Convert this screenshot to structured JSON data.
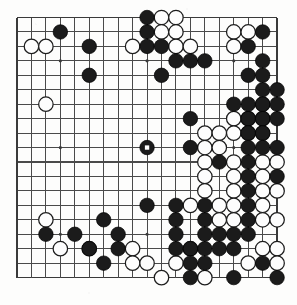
{
  "board": {
    "name": "go-board",
    "size": 19,
    "label": "Go board position",
    "geometry": {
      "origin_x": 17,
      "origin_y": 17.5,
      "spacing": 14.45
    },
    "colors": {
      "background": "#fdfdfc",
      "grid_line": "#4a4a4a",
      "border_line": "#3a3a3a",
      "black_stone": "#1b1b1b",
      "white_stone": "#fdfdfd",
      "stone_outline": "#1d1d1d",
      "marker": "#ffffff"
    },
    "star_points": [
      [
        3,
        3
      ],
      [
        9,
        3
      ],
      [
        15,
        3
      ],
      [
        3,
        9
      ],
      [
        9,
        9
      ],
      [
        15,
        9
      ],
      [
        3,
        15
      ],
      [
        9,
        15
      ],
      [
        15,
        15
      ]
    ],
    "marked_stone": {
      "col": 9,
      "row": 9,
      "marker": "square",
      "color": "black"
    },
    "black_stones": [
      [
        9,
        0
      ],
      [
        17,
        1
      ],
      [
        3,
        1
      ],
      [
        9,
        1
      ],
      [
        9,
        2
      ],
      [
        10,
        2
      ],
      [
        16,
        2
      ],
      [
        5,
        2
      ],
      [
        11,
        3
      ],
      [
        12,
        3
      ],
      [
        13,
        3
      ],
      [
        17,
        3
      ],
      [
        5,
        4
      ],
      [
        10,
        4
      ],
      [
        16,
        4
      ],
      [
        17,
        4
      ],
      [
        17,
        5
      ],
      [
        18,
        5
      ],
      [
        16,
        6
      ],
      [
        17,
        6
      ],
      [
        18,
        6
      ],
      [
        15,
        6
      ],
      [
        12,
        7
      ],
      [
        16,
        7
      ],
      [
        17,
        7
      ],
      [
        18,
        7
      ],
      [
        16,
        8
      ],
      [
        17,
        8
      ],
      [
        9,
        9
      ],
      [
        12,
        9
      ],
      [
        16,
        9
      ],
      [
        17,
        9
      ],
      [
        18,
        9
      ],
      [
        14,
        10
      ],
      [
        16,
        10
      ],
      [
        16,
        11
      ],
      [
        18,
        11
      ],
      [
        16,
        12
      ],
      [
        13,
        13
      ],
      [
        9,
        13
      ],
      [
        11,
        13
      ],
      [
        16,
        13
      ],
      [
        6,
        14
      ],
      [
        16,
        14
      ],
      [
        11,
        14
      ],
      [
        13,
        14
      ],
      [
        2,
        15
      ],
      [
        4,
        15
      ],
      [
        7,
        15
      ],
      [
        11,
        15
      ],
      [
        16,
        15
      ],
      [
        13,
        15
      ],
      [
        14,
        15
      ],
      [
        15,
        15
      ],
      [
        5,
        16
      ],
      [
        7,
        16
      ],
      [
        11,
        16
      ],
      [
        12,
        16
      ],
      [
        13,
        16
      ],
      [
        14,
        16
      ],
      [
        15,
        16
      ],
      [
        6,
        17
      ],
      [
        12,
        17
      ],
      [
        13,
        17
      ],
      [
        17,
        17
      ],
      [
        12,
        18
      ],
      [
        15,
        18
      ],
      [
        18,
        18
      ]
    ],
    "white_stones": [
      [
        10,
        0
      ],
      [
        11,
        0
      ],
      [
        10,
        1
      ],
      [
        11,
        1
      ],
      [
        15,
        1
      ],
      [
        16,
        1
      ],
      [
        1,
        2
      ],
      [
        2,
        2
      ],
      [
        8,
        2
      ],
      [
        11,
        2
      ],
      [
        12,
        2
      ],
      [
        15,
        2
      ],
      [
        2,
        6
      ],
      [
        2,
        14
      ],
      [
        17,
        6
      ],
      [
        15,
        7
      ],
      [
        16,
        7
      ],
      [
        17,
        7
      ],
      [
        13,
        8
      ],
      [
        14,
        8
      ],
      [
        15,
        8
      ],
      [
        16,
        8
      ],
      [
        17,
        8
      ],
      [
        13,
        9
      ],
      [
        14,
        9
      ],
      [
        13,
        10
      ],
      [
        15,
        10
      ],
      [
        17,
        10
      ],
      [
        18,
        10
      ],
      [
        13,
        11
      ],
      [
        15,
        11
      ],
      [
        17,
        11
      ],
      [
        13,
        12
      ],
      [
        15,
        12
      ],
      [
        17,
        12
      ],
      [
        18,
        12
      ],
      [
        12,
        13
      ],
      [
        14,
        13
      ],
      [
        15,
        13
      ],
      [
        17,
        13
      ],
      [
        14,
        14
      ],
      [
        15,
        14
      ],
      [
        17,
        14
      ],
      [
        18,
        14
      ],
      [
        3,
        16
      ],
      [
        5,
        16
      ],
      [
        8,
        16
      ],
      [
        12,
        16
      ],
      [
        17,
        16
      ],
      [
        18,
        16
      ],
      [
        8,
        17
      ],
      [
        9,
        17
      ],
      [
        11,
        17
      ],
      [
        16,
        17
      ],
      [
        18,
        17
      ],
      [
        10,
        18
      ],
      [
        13,
        18
      ]
    ]
  }
}
